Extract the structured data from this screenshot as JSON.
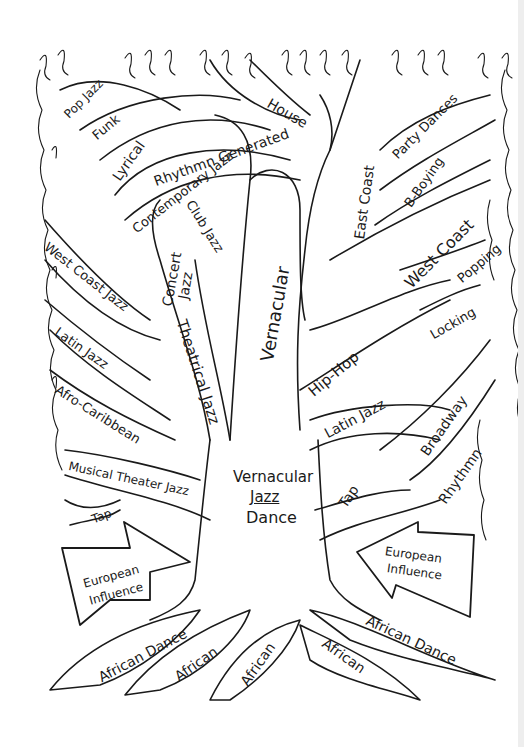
{
  "diagram": {
    "type": "hand-drawn tree",
    "trunk_label": {
      "line1": "Vernacular",
      "line2": "Jazz",
      "line3": "Dance"
    },
    "main_branches": {
      "vernacular": "Vernacular",
      "theatrical_jazz": "Theatrical Jazz",
      "concert_jazz": {
        "line1": "Concert",
        "line2": "Jazz"
      },
      "hip_hop": "Hip-Hop",
      "east_coast": "East Coast",
      "west_coast": "West Coast"
    },
    "left_branches": [
      {
        "label": "Pop Jazz"
      },
      {
        "label": "Funk"
      },
      {
        "label": "Lyrical"
      },
      {
        "label": "Rhythmn Generated"
      },
      {
        "label": "Contemporary Jazz"
      },
      {
        "label": "Club Jazz"
      },
      {
        "label": "West Coast Jazz"
      },
      {
        "label": "Latin Jazz"
      },
      {
        "label": "Afro-Caribbean"
      },
      {
        "label": "Musical Theater Jazz"
      },
      {
        "label": "Tap"
      }
    ],
    "top_branches": [
      {
        "label": "House"
      }
    ],
    "right_branches": [
      {
        "label": "Party Dances"
      },
      {
        "label": "B-Boying"
      },
      {
        "label": "Popping"
      },
      {
        "label": "Locking"
      },
      {
        "label": "Latin Jazz"
      },
      {
        "label": "Broadway"
      },
      {
        "label": "Rhythmn"
      },
      {
        "label": "Tap"
      }
    ],
    "influence_arrows": [
      {
        "line1": "European",
        "line2": "Influence",
        "direction": "right"
      },
      {
        "line1": "European",
        "line2": "Influence",
        "direction": "left"
      }
    ],
    "roots": [
      {
        "label": "African Dance"
      },
      {
        "label": "African"
      },
      {
        "label": "African"
      },
      {
        "label": "African"
      },
      {
        "label": "African Dance"
      }
    ],
    "colors": {
      "ink": "#1a1a1a",
      "paper": "#ffffff"
    }
  }
}
